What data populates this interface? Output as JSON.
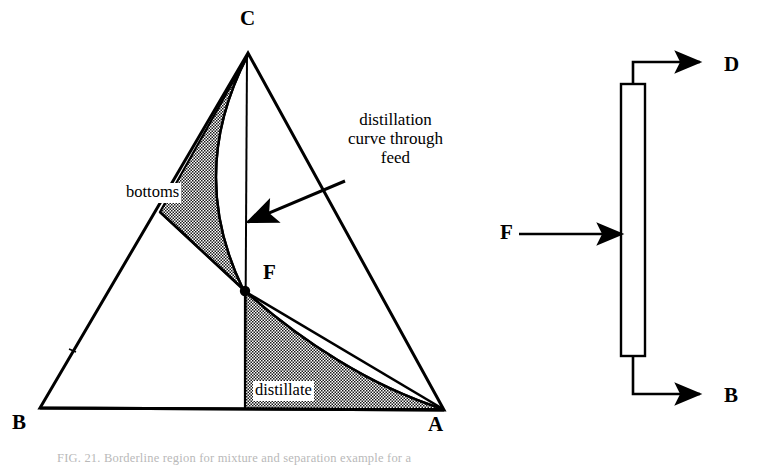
{
  "figure": {
    "caption": "FIG. 21.  Borderline region for mixture and separation example for a",
    "caption_prefix": "FIG. 21.",
    "caption_rest": "Borderline region for mixture and separation example for a"
  },
  "ternary_diagram": {
    "vertices": [
      {
        "label": "A",
        "x": 444,
        "y": 410,
        "label_x": 428,
        "label_y": 414
      },
      {
        "label": "B",
        "x": 40,
        "y": 408,
        "label_x": 12,
        "label_y": 412
      },
      {
        "label": "C",
        "x": 248,
        "y": 53,
        "label_x": 240,
        "label_y": 8
      }
    ],
    "feed_point": {
      "label": "F",
      "x": 245,
      "y": 291,
      "label_x": 263,
      "label_y": 262
    },
    "region_labels": [
      {
        "name": "bottoms",
        "text": "bottoms",
        "x": 124,
        "y": 183
      },
      {
        "name": "distillate",
        "text": "distillate",
        "x": 253,
        "y": 381
      }
    ],
    "annotation": {
      "text": "distillation\ncurve through\nfeed",
      "x": 333,
      "y": 110,
      "arrow_tip_x": 242,
      "arrow_tip_y": 222,
      "arrow_tail_x": 345,
      "arrow_tail_y": 181
    },
    "curve_note": "distillation curve from C through F to A",
    "shaded_fill": "#9a9a9a",
    "line_color": "#000000"
  },
  "column_diagram": {
    "streams": [
      {
        "name": "distillate-out",
        "label": "D",
        "label_x": 724,
        "label_y": 54
      },
      {
        "name": "feed-in",
        "label": "F",
        "label_x": 500,
        "label_y": 222
      },
      {
        "name": "bottoms-out",
        "label": "B",
        "label_x": 724,
        "label_y": 385
      }
    ],
    "column": {
      "x": 621,
      "y": 84,
      "width": 24,
      "height": 272
    },
    "line_color": "#000000"
  }
}
